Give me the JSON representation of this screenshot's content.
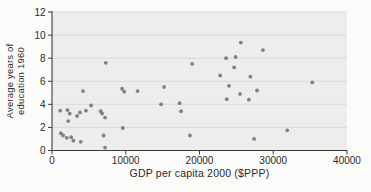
{
  "colors": {
    "page_bg": "#FBFBFA",
    "plot_bg": "#EDEDEB",
    "gridline": "#D5D5D2",
    "axis": "#3C3C3C",
    "dot": "#747474",
    "text": "#2B2B2B"
  },
  "chart_data": {
    "type": "scatter",
    "title": "",
    "xlabel": "GDP per capita 2000 ($PPP)",
    "ylabel": "Average years of education 1960",
    "ylabel_lines": [
      "Average years of",
      "education 1960"
    ],
    "xlim": [
      0,
      40000
    ],
    "ylim": [
      0,
      12
    ],
    "x_ticks": [
      0,
      10000,
      20000,
      30000,
      40000
    ],
    "x_tick_labels": [
      "0",
      "10000",
      "20000",
      "30000",
      "40000"
    ],
    "y_ticks": [
      0,
      2,
      4,
      6,
      8,
      10,
      12
    ],
    "y_tick_labels": [
      "0",
      "2",
      "4",
      "6",
      "8",
      "10",
      "12"
    ],
    "grid": "horizontal",
    "legend": "none",
    "points": [
      [
        1100,
        3.45
      ],
      [
        2100,
        3.5
      ],
      [
        2400,
        3.2
      ],
      [
        2200,
        2.55
      ],
      [
        1200,
        1.5
      ],
      [
        1500,
        1.3
      ],
      [
        2000,
        1.1
      ],
      [
        2600,
        1.15
      ],
      [
        2900,
        0.85
      ],
      [
        3800,
        3.3
      ],
      [
        3400,
        3.0
      ],
      [
        4200,
        5.15
      ],
      [
        4600,
        3.45
      ],
      [
        3900,
        0.75
      ],
      [
        5300,
        3.9
      ],
      [
        6600,
        3.4
      ],
      [
        6800,
        3.2
      ],
      [
        7300,
        7.6
      ],
      [
        7200,
        2.85
      ],
      [
        7000,
        1.3
      ],
      [
        7200,
        0.25
      ],
      [
        9500,
        5.35
      ],
      [
        9800,
        5.1
      ],
      [
        9600,
        1.95
      ],
      [
        11600,
        5.15
      ],
      [
        14800,
        4.0
      ],
      [
        15200,
        5.5
      ],
      [
        17300,
        4.1
      ],
      [
        17500,
        3.4
      ],
      [
        18700,
        1.3
      ],
      [
        19000,
        7.5
      ],
      [
        22800,
        6.5
      ],
      [
        23600,
        8.0
      ],
      [
        24900,
        8.1
      ],
      [
        24700,
        7.2
      ],
      [
        25600,
        9.35
      ],
      [
        24000,
        5.6
      ],
      [
        23700,
        4.45
      ],
      [
        25500,
        4.9
      ],
      [
        26900,
        6.4
      ],
      [
        27800,
        5.2
      ],
      [
        26700,
        4.4
      ],
      [
        28600,
        8.7
      ],
      [
        27400,
        1.0
      ],
      [
        31900,
        1.75
      ],
      [
        35300,
        5.9
      ]
    ]
  }
}
